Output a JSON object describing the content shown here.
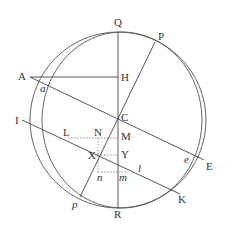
{
  "diagram": {
    "labels": {
      "Q": "Q",
      "P": "P",
      "A": "A",
      "a": "a",
      "H": "H",
      "C": "C",
      "I": "I",
      "L": "L",
      "N": "N",
      "M": "M",
      "X": "X",
      "Y": "Y",
      "n": "n",
      "m": "m",
      "l": "l",
      "e": "e",
      "E": "E",
      "K": "K",
      "R": "R",
      "p": "p"
    },
    "colors": {
      "stroke": "#444444",
      "text": "#333333",
      "background": "#ffffff"
    }
  }
}
